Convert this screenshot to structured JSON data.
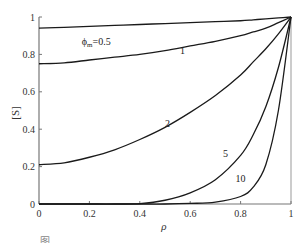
{
  "chart_data": {
    "type": "line",
    "title": "",
    "xlabel": "ρ",
    "ylabel": "[S]",
    "xlim": [
      0,
      1
    ],
    "ylim": [
      0,
      1
    ],
    "grid": false,
    "legend": "none (inline curve labels)",
    "x_ticks": [
      "0",
      "0.2",
      "0.4",
      "0.6",
      "0.8",
      "1"
    ],
    "y_ticks": [
      "0",
      "0.2",
      "0.4",
      "0.6",
      "0.8",
      "1"
    ],
    "x": [
      0,
      0.1,
      0.2,
      0.3,
      0.4,
      0.5,
      0.6,
      0.7,
      0.8,
      0.85,
      0.9,
      0.95,
      1.0
    ],
    "series": [
      {
        "name": "φm=0.5",
        "label": "ϕm=0.5",
        "values": [
          0.94,
          0.945,
          0.95,
          0.955,
          0.96,
          0.965,
          0.97,
          0.975,
          0.98,
          0.985,
          0.99,
          0.995,
          1.0
        ]
      },
      {
        "name": "1",
        "label": "1",
        "values": [
          0.75,
          0.755,
          0.77,
          0.785,
          0.8,
          0.82,
          0.845,
          0.87,
          0.9,
          0.92,
          0.94,
          0.97,
          1.0
        ]
      },
      {
        "name": "2",
        "label": "2",
        "values": [
          0.21,
          0.22,
          0.25,
          0.29,
          0.345,
          0.41,
          0.49,
          0.58,
          0.69,
          0.76,
          0.83,
          0.91,
          1.0
        ]
      },
      {
        "name": "5",
        "label": "5",
        "values": [
          0.0,
          0.0,
          0.0,
          0.0,
          0.002,
          0.02,
          0.06,
          0.13,
          0.26,
          0.37,
          0.52,
          0.73,
          1.0
        ]
      },
      {
        "name": "10",
        "label": "10",
        "values": [
          0.0,
          0.0,
          0.0,
          0.0,
          0.0,
          0.0,
          0.003,
          0.01,
          0.04,
          0.09,
          0.21,
          0.5,
          1.0
        ]
      }
    ],
    "annotations": [
      {
        "text": "ϕm=0.5",
        "x": 0.17,
        "y": 0.85
      },
      {
        "text": "1",
        "x": 0.56,
        "y": 0.8
      },
      {
        "text": "2",
        "x": 0.5,
        "y": 0.41
      },
      {
        "text": "5",
        "x": 0.73,
        "y": 0.25
      },
      {
        "text": "10",
        "x": 0.78,
        "y": 0.12
      }
    ]
  },
  "axes": {
    "y_label": "[S]",
    "x_label": "ρ"
  },
  "caption": "图 ……"
}
